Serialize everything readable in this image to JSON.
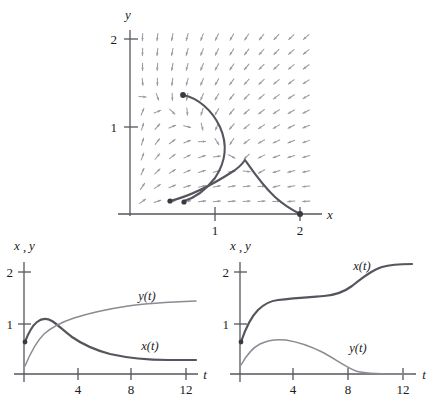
{
  "figure": {
    "title": "",
    "background": "#ffffff",
    "ink_color": "#4a4a52",
    "arrow_color": "#9a9aa2",
    "curve_color": "#55555d"
  },
  "phase_plot": {
    "xlabel": "x",
    "ylabel": "y",
    "x_ticks": [
      "1",
      "2"
    ],
    "y_ticks": [
      "1",
      "2"
    ],
    "x_tick_values": [
      1,
      2
    ],
    "y_tick_values": [
      1,
      2
    ],
    "field_type": "direction-field",
    "field_grid": "12 x 12"
  },
  "left_plot": {
    "ylabel": "x , y",
    "ylabel_x": "x",
    "ylabel_comma": ",",
    "ylabel_y": "y",
    "xlabel": "t",
    "x_ticks": [
      "4",
      "8",
      "12"
    ],
    "y_ticks": [
      "1",
      "2"
    ],
    "curve_labels": {
      "x": "x(t)",
      "y": "y(t)"
    }
  },
  "right_plot": {
    "ylabel_x": "x",
    "ylabel_comma": ",",
    "ylabel_y": "y",
    "xlabel": "t",
    "x_ticks": [
      "4",
      "8",
      "12"
    ],
    "y_ticks": [
      "1",
      "2"
    ],
    "curve_labels": {
      "x": "x(t)",
      "y": "y(t)"
    }
  },
  "chart_data": [
    {
      "type": "line",
      "name": "phase-portrait",
      "title": "",
      "xlabel": "x",
      "ylabel": "y",
      "xlim": [
        -0.05,
        2.15
      ],
      "ylim": [
        -0.05,
        2.1
      ],
      "xticks": [
        1,
        2
      ],
      "yticks": [
        1,
        2
      ],
      "grid": false,
      "legend": "none",
      "annotations": [
        "direction field arrows on 12x12 grid"
      ],
      "series": [
        {
          "name": "trajectory-1",
          "marker_start": [
            0.62,
            1.37
          ],
          "marker_end": [
            0.47,
            0.15
          ],
          "x": [
            0.62,
            0.78,
            0.92,
            1.02,
            1.06,
            1.02,
            0.92,
            0.8,
            0.68,
            0.56,
            0.47
          ],
          "y": [
            1.37,
            1.3,
            1.18,
            1.02,
            0.86,
            0.7,
            0.55,
            0.42,
            0.3,
            0.21,
            0.15
          ]
        },
        {
          "name": "trajectory-2",
          "marker_start": [
            0.62,
            0.12
          ],
          "corner": [
            1.33,
            0.62
          ],
          "marker_end": [
            2.0,
            0.0
          ],
          "x": [
            0.62,
            0.8,
            0.98,
            1.14,
            1.26,
            1.33,
            1.45,
            1.6,
            1.76,
            1.9,
            2.0
          ],
          "y": [
            0.12,
            0.22,
            0.34,
            0.46,
            0.56,
            0.62,
            0.52,
            0.38,
            0.24,
            0.1,
            0.0
          ]
        }
      ]
    },
    {
      "type": "line",
      "name": "left-time-series",
      "title": "",
      "xlabel": "t",
      "ylabel": "x , y",
      "xlim": [
        0,
        13
      ],
      "ylim": [
        0,
        2.35
      ],
      "xticks": [
        4,
        8,
        12
      ],
      "yticks": [
        1,
        2
      ],
      "grid": false,
      "legend": "inline-labels",
      "series": [
        {
          "name": "x(t)",
          "label": "x(t)",
          "start": [
            0,
            0.62
          ],
          "x": [
            0,
            0.4,
            0.8,
            1.2,
            1.6,
            2.0,
            2.5,
            3.0,
            4.0,
            5.0,
            6.0,
            7.0,
            8.0,
            9.0,
            10.0,
            11.0,
            12.0,
            13.0
          ],
          "y": [
            0.62,
            0.85,
            1.02,
            1.12,
            1.16,
            1.15,
            1.1,
            1.05,
            0.95,
            0.87,
            0.81,
            0.77,
            0.74,
            0.72,
            0.71,
            0.7,
            0.695,
            0.69
          ]
        },
        {
          "name": "y(t)",
          "label": "y(t)",
          "start": [
            0,
            0.18
          ],
          "x": [
            0,
            0.4,
            0.8,
            1.2,
            1.6,
            2.0,
            2.5,
            3.0,
            4.0,
            5.0,
            6.0,
            7.0,
            8.0,
            9.0,
            10.0,
            11.0,
            12.0,
            13.0
          ],
          "y": [
            0.18,
            0.5,
            0.75,
            0.92,
            1.02,
            1.08,
            1.14,
            1.19,
            1.26,
            1.31,
            1.34,
            1.36,
            1.375,
            1.385,
            1.39,
            1.395,
            1.4,
            1.4
          ]
        }
      ]
    },
    {
      "type": "line",
      "name": "right-time-series",
      "title": "",
      "xlabel": "t",
      "ylabel": "x , y",
      "xlim": [
        0,
        13
      ],
      "ylim": [
        0,
        2.35
      ],
      "xticks": [
        4,
        8,
        12
      ],
      "yticks": [
        1,
        2
      ],
      "grid": false,
      "legend": "inline-labels",
      "series": [
        {
          "name": "x(t)",
          "label": "x(t)",
          "start": [
            0,
            0.62
          ],
          "x": [
            0,
            0.4,
            0.8,
            1.2,
            1.6,
            2.0,
            3.0,
            4.0,
            5.0,
            6.0,
            7.0,
            8.0,
            9.0,
            10.0,
            11.0,
            12.0,
            13.0
          ],
          "y": [
            0.62,
            0.95,
            1.18,
            1.3,
            1.36,
            1.38,
            1.4,
            1.42,
            1.44,
            1.47,
            1.53,
            1.66,
            1.82,
            1.94,
            1.99,
            2.0,
            2.0
          ]
        },
        {
          "name": "y(t)",
          "label": "y(t)",
          "start": [
            0,
            0.17
          ],
          "x": [
            0,
            0.4,
            0.8,
            1.2,
            1.6,
            2.0,
            2.6,
            3.0,
            4.0,
            5.0,
            6.0,
            7.0,
            8.0,
            9.0,
            10.0,
            11.0,
            12.0,
            13.0
          ],
          "y": [
            0.17,
            0.42,
            0.56,
            0.63,
            0.66,
            0.67,
            0.665,
            0.65,
            0.6,
            0.54,
            0.47,
            0.38,
            0.26,
            0.13,
            0.05,
            0.02,
            0.01,
            0.01
          ]
        }
      ]
    }
  ]
}
